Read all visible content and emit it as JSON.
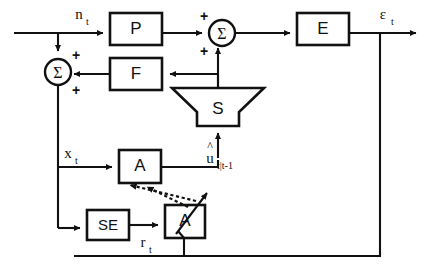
{
  "figure": {
    "type": "block-diagram",
    "background_color": "#ffffff",
    "line_color": "#111111"
  },
  "blocks": [
    {
      "id": "P",
      "label": "P",
      "shape": "rectangle",
      "x": 110,
      "y": 13,
      "w": 52,
      "h": 32
    },
    {
      "id": "F",
      "label": "F",
      "shape": "rectangle",
      "x": 110,
      "y": 58,
      "w": 52,
      "h": 32
    },
    {
      "id": "E",
      "label": "E",
      "shape": "rectangle",
      "x": 297,
      "y": 13,
      "w": 52,
      "h": 32
    },
    {
      "id": "S",
      "label": "S",
      "shape": "funnel",
      "x": 172,
      "y": 88,
      "w": 92,
      "h": 38
    },
    {
      "id": "A1",
      "label": "A",
      "shape": "rectangle",
      "x": 119,
      "y": 150,
      "w": 42,
      "h": 33
    },
    {
      "id": "SE",
      "label": "SE",
      "shape": "rectangle",
      "x": 87,
      "y": 210,
      "w": 42,
      "h": 30
    },
    {
      "id": "A2",
      "label": "A",
      "shape": "rectangle",
      "x": 165,
      "y": 205,
      "w": 40,
      "h": 33
    }
  ],
  "summing_junctions": [
    {
      "id": "sum-left",
      "symbol": "Σ",
      "cx": 58,
      "cy": 72,
      "r": 13,
      "signs": [
        {
          "text": "+",
          "position": "top-right"
        },
        {
          "text": "+",
          "position": "bottom-right"
        }
      ]
    },
    {
      "id": "sum-right",
      "symbol": "Σ",
      "cx": 222,
      "cy": 33,
      "r": 13,
      "signs": [
        {
          "text": "+",
          "position": "top-left"
        },
        {
          "text": "+",
          "position": "bottom-left"
        }
      ]
    }
  ],
  "signals": [
    {
      "id": "n_t",
      "base": "n",
      "sub": "t",
      "hat": false,
      "x": 84,
      "y": 14
    },
    {
      "id": "eps_t",
      "base": "ε",
      "sub": "t",
      "hat": false,
      "x": 388,
      "y": 14
    },
    {
      "id": "x_t",
      "base": "x",
      "sub": "t",
      "hat": false,
      "x": 67,
      "y": 153
    },
    {
      "id": "r_t",
      "base": "r",
      "sub": "t",
      "hat": false,
      "x": 145,
      "y": 243
    },
    {
      "id": "u_hat",
      "base": "u",
      "sub": "t|t-1",
      "hat": true,
      "x": 212,
      "y": 165
    }
  ],
  "connections": [
    {
      "from": "input-left",
      "to": "P",
      "style": "solid"
    },
    {
      "from": "n_t-branch",
      "to": "sum-left",
      "style": "solid"
    },
    {
      "from": "P",
      "to": "sum-right",
      "style": "solid"
    },
    {
      "from": "sum-right",
      "to": "E",
      "style": "solid"
    },
    {
      "from": "E",
      "to": "eps_t-out",
      "style": "solid"
    },
    {
      "from": "S",
      "to": "sum-right",
      "style": "solid"
    },
    {
      "from": "S-tap",
      "to": "F",
      "style": "solid"
    },
    {
      "from": "F",
      "to": "sum-left",
      "style": "solid"
    },
    {
      "from": "sum-left",
      "to": "x_t-bus",
      "style": "solid"
    },
    {
      "from": "x_t-bus",
      "to": "A1",
      "style": "solid"
    },
    {
      "from": "x_t-bus",
      "to": "SE",
      "style": "solid"
    },
    {
      "from": "A1",
      "to": "S",
      "style": "solid"
    },
    {
      "from": "SE",
      "to": "A2",
      "style": "solid"
    },
    {
      "from": "A2",
      "to": "A1",
      "style": "dotted"
    },
    {
      "from": "A1",
      "to": "A2",
      "style": "dotted"
    },
    {
      "from": "eps_t-fb",
      "to": "A2",
      "style": "solid"
    }
  ],
  "caption": {
    "text": ""
  }
}
